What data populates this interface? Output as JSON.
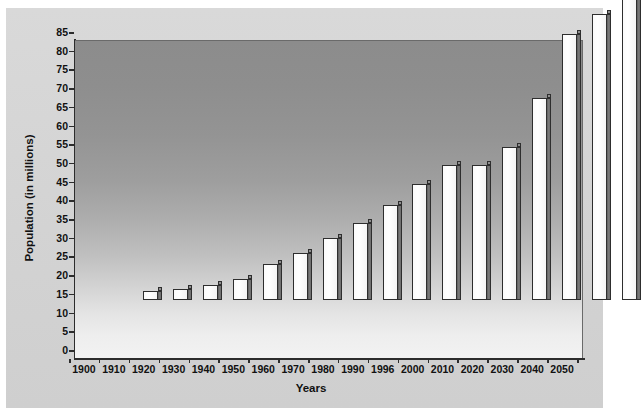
{
  "chart_data": {
    "type": "bar",
    "title": "",
    "xlabel": "Years",
    "ylabel": "Population (in millions)",
    "categories": [
      "1900",
      "1910",
      "1920",
      "1930",
      "1940",
      "1950",
      "1960",
      "1970",
      "1980",
      "1990",
      "1996",
      "2000",
      "2010",
      "2020",
      "2030",
      "2040",
      "2050"
    ],
    "values": [
      2.5,
      3,
      4,
      5.5,
      9.5,
      12.5,
      16.5,
      20.5,
      25.5,
      31,
      36,
      36,
      41,
      54,
      71,
      76.5,
      81
    ],
    "ylim": [
      0,
      85
    ],
    "yticks": [
      0,
      5,
      10,
      15,
      20,
      25,
      30,
      35,
      40,
      45,
      50,
      55,
      60,
      65,
      70,
      75,
      80,
      85
    ],
    "grid": false,
    "legend": "none",
    "bar_style": "3d-outlined-white",
    "colors": {
      "bar_face": "#ffffff",
      "bar_edge": "#2e2e2e",
      "bar_side": "#6f6f6f",
      "plot_bg_top": "#8c8c8c",
      "plot_bg_bottom": "#f2f2f2",
      "canvas_bg": "#d5d5d5",
      "text": "#111111"
    }
  }
}
